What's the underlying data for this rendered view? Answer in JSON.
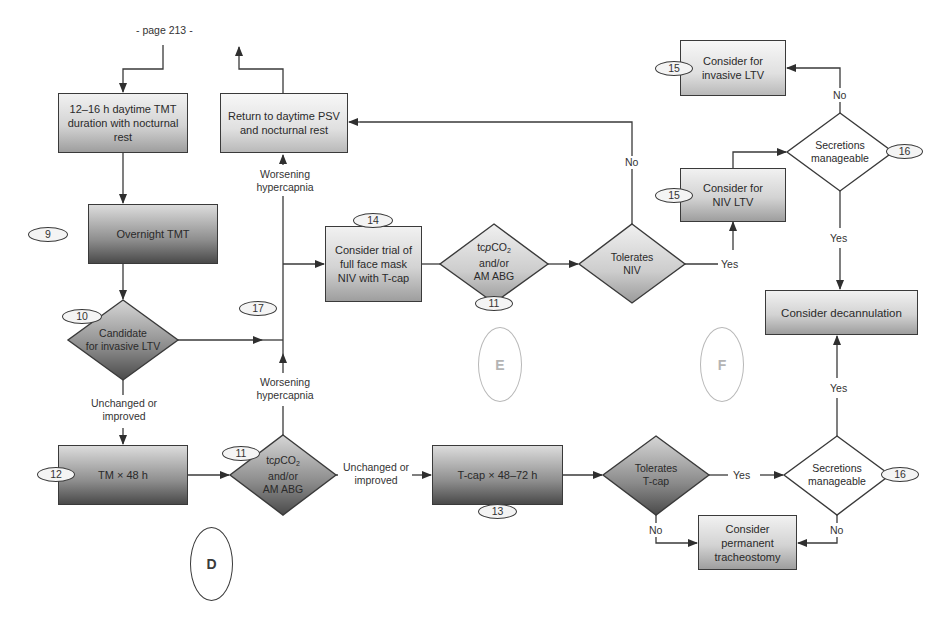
{
  "page_label": "- page 213 -",
  "nodes": {
    "daytime_tmt": {
      "text": "12–16 h daytime TMT duration with nocturnal rest"
    },
    "return_daytime": {
      "text": "Return to daytime PSV and nocturnal rest"
    },
    "overnight_tmt": {
      "text": "Overnight TMT",
      "badge": "9"
    },
    "candidate_invasive": {
      "line1": "Candidate",
      "line2": "for invasive LTV",
      "badge": "10"
    },
    "trial_full_face": {
      "text": "Consider trial of full face mask NIV with T-cap",
      "badge": "14"
    },
    "tcpco2_top": {
      "line1_pre": "tc",
      "line1_italic": "p",
      "line1_post": "CO",
      "line1_sub": "2",
      "line2": "and/or",
      "line3": "AM ABG",
      "badge": "11"
    },
    "tolerates_niv": {
      "line1": "Tolerates",
      "line2": "NIV"
    },
    "consider_niv_ltv": {
      "text": "Consider for NIV LTV",
      "badge": "15"
    },
    "consider_invasive_ltv": {
      "text": "Consider for invasive LTV",
      "badge": "15"
    },
    "secretions_top": {
      "line1": "Secretions",
      "line2": "manageable",
      "badge": "16"
    },
    "decannulation": {
      "text": "Consider decannulation"
    },
    "tm_48h": {
      "text": "TM × 48 h",
      "badge": "12"
    },
    "tcpco2_bottom": {
      "line1_pre": "tc",
      "line1_italic": "p",
      "line1_post": "CO",
      "line1_sub": "2",
      "line2": "and/or",
      "line3": "AM ABG",
      "badge": "11"
    },
    "tcap_48_72": {
      "text": "T-cap × 48–72 h",
      "badge": "13"
    },
    "tolerates_tcap": {
      "line1": "Tolerates",
      "line2": "T-cap"
    },
    "secretions_bottom": {
      "line1": "Secretions",
      "line2": "manageable",
      "badge": "16"
    },
    "permanent_trach": {
      "text": "Consider permanent tracheostomy"
    }
  },
  "edge_labels": {
    "worsening_top": "Worsening hypercapnia",
    "worsening_bottom": "Worsening hypercapnia",
    "unchanged_left": "Unchanged or improved",
    "unchanged_bottom": "Unchanged or improved",
    "no_niv": "No",
    "yes_niv": "Yes",
    "no_secretions_top": "No",
    "yes_secretions_top": "Yes",
    "yes_tcap": "Yes",
    "no_tcap": "No",
    "no_secretions_bottom": "No",
    "yes_secretions_bottom": "Yes"
  },
  "standalone_badges": {
    "b17": "17"
  },
  "section_markers": {
    "D": "D",
    "E": "E",
    "F": "F"
  },
  "colors": {
    "line": "#3a3a3a",
    "marker_gray": "#b8b8b8"
  }
}
